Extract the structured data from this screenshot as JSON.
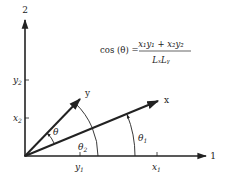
{
  "diagram": {
    "axes": {
      "horizontal_label": "1",
      "vertical_label": "2"
    },
    "vectors": [
      {
        "name": "x",
        "label": "x",
        "components": [
          "x1",
          "x2"
        ]
      },
      {
        "name": "y",
        "label": "y",
        "components": [
          "y1",
          "y2"
        ]
      }
    ],
    "ticks": {
      "x1": {
        "base": "x",
        "sub": "1"
      },
      "y1": {
        "base": "y",
        "sub": "1"
      },
      "x2": {
        "base": "x",
        "sub": "2"
      },
      "y2": {
        "base": "y",
        "sub": "2"
      }
    },
    "angles": {
      "theta": "θ",
      "theta1": {
        "base": "θ",
        "sub": "1"
      },
      "theta2": {
        "base": "θ",
        "sub": "2"
      }
    },
    "formula": {
      "lhs": "cos (θ) =",
      "numerator": "x₁y₁ + x₂y₂",
      "denominator": "LₓLᵧ"
    },
    "colors": {
      "line": "#222222",
      "background": "#ffffff"
    }
  }
}
